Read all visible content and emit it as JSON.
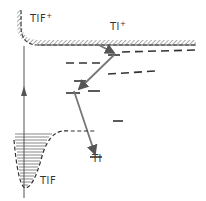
{
  "diagram": {
    "type": "energy-level-diagram",
    "labels": {
      "tlf_ion": "TlF",
      "tlf_ion_charge": "+",
      "tl_ion": "Tl",
      "tl_ion_charge": "+",
      "tl_atom": "Tl",
      "tlf_molecule": "TlF"
    },
    "elements": [
      {
        "id": "tlf-plus-boundary",
        "kind": "hatched-curve",
        "description": "Ionization continuum boundary of TlF+ curving down into horizontal Tl+ limit"
      },
      {
        "id": "tl-plus-limit",
        "kind": "hatched-line",
        "description": "Tl+ ionization limit"
      },
      {
        "id": "rydberg-levels",
        "kind": "dashed-levels",
        "count": 4
      },
      {
        "id": "cascade-arrows",
        "kind": "arrows",
        "count": 3
      },
      {
        "id": "excitation-arrow",
        "kind": "vertical-arrow",
        "description": "Photo-excitation from TlF ground state"
      },
      {
        "id": "tlf-potential-well",
        "kind": "potential-curve",
        "description": "Ground-state TlF potential with vibrational levels"
      }
    ],
    "colors": {
      "ink": "#333333",
      "arrow": "#777777",
      "background": "#ffffff"
    }
  }
}
